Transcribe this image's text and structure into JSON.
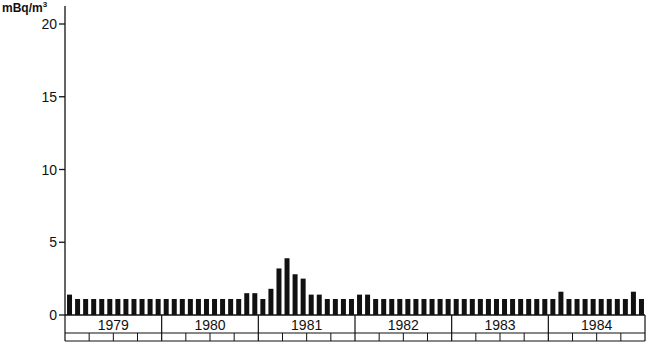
{
  "chart_data": {
    "type": "bar",
    "title": "",
    "ylabel": "mBq/m3",
    "ylabel_unit_base": "mBq/m",
    "ylabel_unit_exp": "3",
    "xlabel": "",
    "ylim": [
      0,
      20
    ],
    "yticks": [
      0,
      5,
      10,
      15,
      20
    ],
    "grid": false,
    "legend": null,
    "years": [
      "1979",
      "1980",
      "1981",
      "1982",
      "1983",
      "1984"
    ],
    "periods_per_year": 12,
    "quarter_boxes_per_year": 4,
    "series": [
      {
        "name": "monthly concentration",
        "color": "#111111",
        "values": [
          1.4,
          1.1,
          1.1,
          1.1,
          1.1,
          1.1,
          1.1,
          1.1,
          1.1,
          1.1,
          1.1,
          1.1,
          1.1,
          1.1,
          1.1,
          1.1,
          1.1,
          1.1,
          1.1,
          1.1,
          1.1,
          1.1,
          1.5,
          1.5,
          1.1,
          1.8,
          3.2,
          3.9,
          2.8,
          2.5,
          1.4,
          1.4,
          1.1,
          1.1,
          1.1,
          1.1,
          1.4,
          1.4,
          1.1,
          1.1,
          1.1,
          1.1,
          1.1,
          1.1,
          1.1,
          1.1,
          1.1,
          1.1,
          1.1,
          1.1,
          1.1,
          1.1,
          1.1,
          1.1,
          1.1,
          1.1,
          1.1,
          1.1,
          1.1,
          1.1,
          1.1,
          1.6,
          1.1,
          1.1,
          1.1,
          1.1,
          1.1,
          1.1,
          1.1,
          1.1,
          1.6,
          1.1
        ]
      }
    ]
  }
}
